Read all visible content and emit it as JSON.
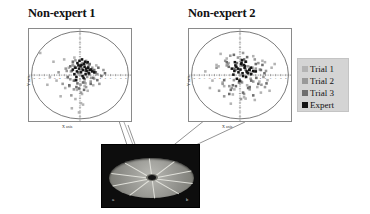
{
  "figure": {
    "background_color": "#ffffff",
    "width": 370,
    "height": 214
  },
  "panels": [
    {
      "id": "non-expert-1",
      "title": "Non-expert 1",
      "xlabel": "X axis",
      "ylabel": "Y axis"
    },
    {
      "id": "non-expert-2",
      "title": "Non-expert 2",
      "xlabel": "X axis",
      "ylabel": "Y axis"
    }
  ],
  "legend": {
    "background_color": "#d4d4d4",
    "items": [
      {
        "label": "Trial 1",
        "color": "#b3b3b3"
      },
      {
        "label": "Trial 2",
        "color": "#999999"
      },
      {
        "label": "Trial 3",
        "color": "#6e6e6e"
      },
      {
        "label": "Expert",
        "color": "#141414"
      }
    ]
  },
  "photo": {
    "caption": "",
    "label_left": "a",
    "label_right": "b",
    "background_color": "#0d0d0d",
    "disc_color": "#9e9e99",
    "spoke_color": "#e6e6e0",
    "spoke_count": 10
  },
  "chart_data": [
    {
      "type": "scatter",
      "title": "Non-expert 1",
      "xlabel": "X axis",
      "ylabel": "Y axis",
      "xlim": [
        -10,
        10
      ],
      "ylim": [
        -10,
        10
      ],
      "grid": false,
      "boundary_circle_radius": 9.5,
      "legend_position": "right-outside",
      "xticks": [
        -9,
        -8,
        -7,
        -6,
        -5,
        -4,
        -3,
        -2,
        -1,
        0,
        1,
        2,
        3,
        4,
        5,
        6,
        7,
        8,
        9
      ],
      "yticks": [
        -9,
        -8,
        -7,
        -6,
        -5,
        -4,
        -3,
        -2,
        -1,
        0,
        1,
        2,
        3,
        4,
        5,
        6,
        7,
        8,
        9
      ],
      "series": [
        {
          "name": "Trial 1",
          "color": "#b3b3b3",
          "x": [
            -7.8,
            -5.2,
            -6.4,
            -3.1,
            -2.2,
            -1.4,
            -0.6,
            0.4,
            1.1,
            2.3,
            3.2,
            -4.6,
            -2.9,
            -1.8,
            -0.9,
            0.9,
            1.9,
            2.8,
            -3.8,
            -1.1,
            0.2,
            1.5,
            -5.9,
            -2.4,
            -0.3,
            1.2,
            2.6,
            -1.6,
            0.6,
            -0.2
          ],
          "y": [
            4.8,
            2.9,
            -2.1,
            3.4,
            1.6,
            2.4,
            -3.2,
            -4.1,
            -1.8,
            1.2,
            2.1,
            -1.2,
            -2.8,
            0.8,
            -5.2,
            -2.4,
            0.4,
            -0.8,
            -4.6,
            3.8,
            -6.1,
            -3.4,
            -0.4,
            -0.6,
            2.2,
            3.1,
            -2.2,
            -7.2,
            -6.4,
            -8.1
          ]
        },
        {
          "name": "Trial 2",
          "color": "#999999",
          "x": [
            -4.2,
            -2.8,
            -1.9,
            -1.1,
            -0.4,
            0.3,
            0.9,
            1.6,
            2.4,
            3.4,
            4.6,
            -3.4,
            -2.1,
            -1.4,
            -0.7,
            0.1,
            0.8,
            1.4,
            2.1,
            2.9,
            -2.6,
            -1.2,
            0.5,
            1.2,
            2.2,
            3.8,
            -0.9,
            0.2,
            1.8,
            -1.7
          ],
          "y": [
            0.6,
            1.4,
            -0.9,
            1.9,
            0.4,
            1.1,
            -1.6,
            0.8,
            1.6,
            0.2,
            1.1,
            -1.9,
            -2.4,
            2.1,
            -1.1,
            -2.1,
            2.4,
            -0.4,
            -1.4,
            0.6,
            0.9,
            -3.1,
            2.6,
            -2.6,
            -0.6,
            -1.9,
            3.2,
            -3.8,
            2.2,
            -4.4
          ]
        },
        {
          "name": "Trial 3",
          "color": "#6e6e6e",
          "x": [
            -2.4,
            -1.6,
            -0.9,
            -0.3,
            0.4,
            1.1,
            1.8,
            2.6,
            3.4,
            4.2,
            -1.9,
            -1.2,
            -0.5,
            0.2,
            0.9,
            1.6,
            2.3,
            3.1,
            -2.1,
            -0.7,
            0.6,
            1.4,
            2.1,
            2.8,
            -1.4,
            -0.2,
            0.8,
            1.9,
            3.6,
            4.9
          ],
          "y": [
            -0.4,
            0.9,
            1.6,
            0.6,
            1.4,
            0.9,
            0.2,
            -0.6,
            -1.1,
            -0.2,
            1.9,
            -1.2,
            -1.8,
            2.1,
            -0.9,
            1.8,
            1.2,
            0.6,
            -2.2,
            -2.6,
            -1.6,
            2.6,
            -1.9,
            1.1,
            2.9,
            -2.9,
            -3.2,
            2.4,
            1.6,
            0.4
          ]
        },
        {
          "name": "Expert",
          "color": "#141414",
          "x": [
            -1.4,
            -0.9,
            -0.6,
            -0.2,
            0.2,
            0.6,
            0.9,
            1.3,
            1.7,
            2.1,
            -1.1,
            -0.7,
            -0.3,
            0.1,
            0.5,
            0.8,
            1.2,
            1.6,
            2.4,
            -0.5,
            0.3,
            0.7,
            1.1,
            1.5,
            1.9,
            -0.8,
            -0.1,
            0.4,
            1.0,
            2.8
          ],
          "y": [
            1.2,
            1.6,
            0.8,
            1.4,
            0.6,
            1.1,
            1.8,
            0.9,
            0.4,
            1.2,
            0.2,
            -0.4,
            2.1,
            1.9,
            -0.2,
            2.4,
            1.4,
            1.6,
            0.8,
            2.6,
            2.2,
            -0.6,
            0.2,
            2.8,
            1.1,
            -1.1,
            3.1,
            3.4,
            2.9,
            0.6
          ]
        }
      ]
    },
    {
      "type": "scatter",
      "title": "Non-expert 2",
      "xlabel": "X axis",
      "ylabel": "Y axis",
      "xlim": [
        -10,
        10
      ],
      "ylim": [
        -10,
        10
      ],
      "grid": false,
      "boundary_circle_radius": 9.5,
      "legend_position": "right-outside",
      "xticks": [
        -9,
        -8,
        -7,
        -6,
        -5,
        -4,
        -3,
        -2,
        -1,
        0,
        1,
        2,
        3,
        4,
        5,
        6,
        7,
        8,
        9
      ],
      "yticks": [
        -9,
        -8,
        -7,
        -6,
        -5,
        -4,
        -3,
        -2,
        -1,
        0,
        1,
        2,
        3,
        4,
        5,
        6,
        7,
        8,
        9
      ],
      "series": [
        {
          "name": "Trial 1",
          "color": "#b3b3b3",
          "x": [
            -6.8,
            -5.4,
            -4.2,
            -3.1,
            -2.2,
            -1.1,
            0.2,
            1.4,
            2.6,
            3.8,
            4.9,
            5.8,
            -5.9,
            -4.6,
            -3.4,
            -2.6,
            -1.4,
            -0.2,
            1.1,
            2.2,
            3.4,
            4.4,
            5.4,
            6.2,
            -3.8,
            -1.8,
            0.8,
            2.9,
            4.1,
            6.8
          ],
          "y": [
            0.8,
            -1.2,
            1.9,
            -2.4,
            2.6,
            -3.1,
            3.4,
            -2.2,
            4.1,
            -1.4,
            2.8,
            -3.4,
            -2.8,
            2.2,
            -1.6,
            3.6,
            -4.2,
            1.2,
            -5.1,
            0.6,
            -2.6,
            3.1,
            -1.1,
            1.6,
            4.6,
            -6.2,
            -4.8,
            -5.4,
            -3.8,
            2.4
          ]
        },
        {
          "name": "Trial 2",
          "color": "#999999",
          "x": [
            -4.6,
            -3.4,
            -2.4,
            -1.6,
            -0.8,
            0.4,
            1.2,
            2.1,
            3.1,
            4.2,
            5.1,
            -4.1,
            -2.9,
            -2.1,
            -1.2,
            -0.4,
            0.8,
            1.6,
            2.6,
            3.6,
            4.6,
            -3.1,
            -1.9,
            0.2,
            1.9,
            2.9,
            4.9,
            -2.6,
            0.6,
            3.9
          ],
          "y": [
            1.6,
            -1.9,
            2.4,
            -2.8,
            1.1,
            -1.6,
            2.9,
            -0.8,
            1.4,
            -2.1,
            0.9,
            -3.4,
            3.1,
            -2.4,
            -1.1,
            3.8,
            -4.1,
            1.9,
            -1.4,
            2.6,
            -0.4,
            -4.6,
            4.2,
            -5.2,
            -3.1,
            3.4,
            -2.6,
            2.1,
            4.8,
            1.2
          ]
        },
        {
          "name": "Trial 3",
          "color": "#6e6e6e",
          "x": [
            -3.1,
            -2.2,
            -1.4,
            -0.6,
            0.2,
            1.1,
            1.9,
            2.8,
            3.6,
            4.4,
            -2.6,
            -1.8,
            -1.1,
            -0.2,
            0.8,
            1.6,
            2.4,
            3.2,
            4.1,
            -2.1,
            -0.8,
            0.6,
            1.4,
            2.2,
            3.1,
            5.2,
            -1.2,
            0.4,
            2.6,
            4.8
          ],
          "y": [
            -1.1,
            1.8,
            -2.2,
            2.6,
            -1.4,
            1.2,
            -2.6,
            0.8,
            -1.9,
            2.2,
            2.8,
            -3.2,
            1.4,
            -1.6,
            3.4,
            -2.8,
            1.6,
            -0.6,
            1.1,
            -4.1,
            -2.4,
            -3.8,
            3.9,
            -1.2,
            2.4,
            -1.8,
            4.4,
            2.1,
            -4.4,
            0.4
          ]
        },
        {
          "name": "Expert",
          "color": "#141414",
          "x": [
            -1.6,
            -1.1,
            -0.7,
            -0.3,
            0.1,
            0.5,
            0.9,
            1.3,
            1.8,
            2.2,
            -1.3,
            -0.9,
            -0.4,
            0.2,
            0.6,
            1.0,
            1.4,
            1.9,
            2.6,
            -0.6,
            0.3,
            0.8,
            1.2,
            1.6,
            2.1,
            -1.0,
            -0.1,
            0.4,
            1.1,
            3.1
          ],
          "y": [
            1.4,
            0.9,
            1.8,
            0.6,
            1.2,
            0.4,
            1.6,
            0.8,
            1.1,
            0.2,
            0.1,
            2.1,
            1.4,
            2.4,
            -0.2,
            1.9,
            0.6,
            1.2,
            0.9,
            -0.8,
            2.6,
            2.2,
            -0.4,
            0.4,
            1.6,
            2.8,
            -1.2,
            3.2,
            2.9,
            0.8
          ]
        }
      ]
    }
  ]
}
